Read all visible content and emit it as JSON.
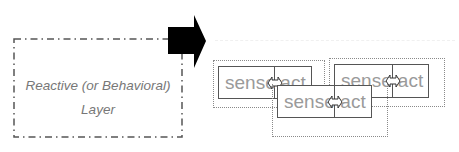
{
  "diagram": {
    "layer_box": {
      "label_line1": "Reactive (or Behavioral)",
      "label_line2": "Layer",
      "border_style": "dash-dot",
      "color": "#555555"
    },
    "arrow": {
      "direction": "right",
      "color": "#000000"
    },
    "modules": [
      {
        "id": "module-left",
        "sense_label": "sense",
        "act_label": "act",
        "connector": "double-arrow"
      },
      {
        "id": "module-right",
        "sense_label": "sense",
        "act_label": "act",
        "connector": "double-arrow"
      },
      {
        "id": "module-front",
        "sense_label": "sense",
        "act_label": "act",
        "connector": "double-arrow"
      }
    ],
    "colors": {
      "text": "#9a9a9a",
      "box_border": "#555555",
      "dotted_border": "#8a8a8a",
      "label_text": "#777777"
    }
  }
}
